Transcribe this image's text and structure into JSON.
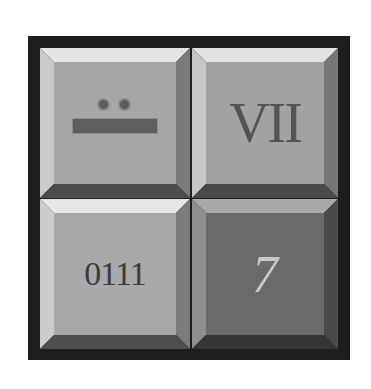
{
  "panel": {
    "frame_color": "#1e1e1e",
    "buttons": [
      {
        "id": "mayan",
        "kind": "mayan-numeral",
        "dots": 2,
        "bars": 1,
        "face_color": "#a6a6a6",
        "label": ""
      },
      {
        "id": "roman",
        "kind": "text",
        "label": "VII",
        "face_color": "#a2a2a2"
      },
      {
        "id": "binary",
        "kind": "text",
        "label": "0111",
        "face_color": "#a9a9a9"
      },
      {
        "id": "arabic",
        "kind": "text",
        "label": "7",
        "face_color": "#6a6a6a"
      }
    ]
  }
}
